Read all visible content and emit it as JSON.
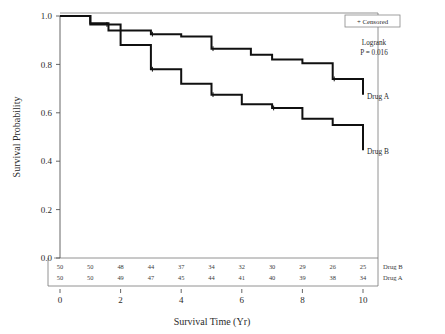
{
  "chart_data": {
    "type": "line",
    "subtype": "kaplan-meier-step",
    "title": "",
    "xlabel": "Survival Time (Yr)",
    "ylabel": "Survival Probability",
    "xlim": [
      0,
      10
    ],
    "ylim": [
      0.0,
      1.0
    ],
    "xticks": [
      0,
      2,
      4,
      6,
      8,
      10
    ],
    "xtick_labels": [
      "0",
      "2",
      "4",
      "6",
      "8",
      "10"
    ],
    "yticks": [
      0.0,
      0.2,
      0.4,
      0.6,
      0.8,
      1.0
    ],
    "ytick_labels": [
      "0.0",
      "0.2",
      "0.4",
      "0.6",
      "0.8",
      "1.0"
    ],
    "grid": false,
    "legend_position": "top-right",
    "series": [
      {
        "name": "Drug A",
        "end_label": "Drug A",
        "x": [
          0.0,
          1.0,
          1.0,
          1.6,
          1.6,
          3.0,
          3.0,
          4.0,
          4.0,
          5.0,
          5.0,
          6.3,
          6.3,
          7.0,
          7.0,
          8.0,
          8.0,
          9.0,
          9.0,
          10.0,
          10.0
        ],
        "y": [
          1.0,
          1.0,
          0.97,
          0.97,
          0.94,
          0.94,
          0.925,
          0.925,
          0.915,
          0.915,
          0.865,
          0.865,
          0.84,
          0.84,
          0.82,
          0.82,
          0.805,
          0.805,
          0.74,
          0.74,
          0.675
        ],
        "steps": [
          {
            "time": 0.0,
            "survival": 1.0
          },
          {
            "time": 1.0,
            "survival": 0.97
          },
          {
            "time": 1.6,
            "survival": 0.94
          },
          {
            "time": 3.0,
            "survival": 0.925
          },
          {
            "time": 4.0,
            "survival": 0.915
          },
          {
            "time": 5.0,
            "survival": 0.865
          },
          {
            "time": 6.3,
            "survival": 0.84
          },
          {
            "time": 7.0,
            "survival": 0.82
          },
          {
            "time": 8.0,
            "survival": 0.805
          },
          {
            "time": 9.0,
            "survival": 0.74
          },
          {
            "time": 10.0,
            "survival": 0.675
          }
        ]
      },
      {
        "name": "Drug B",
        "end_label": "Drug B",
        "x": [
          0.0,
          1.0,
          1.0,
          2.0,
          2.0,
          3.0,
          3.0,
          4.0,
          4.0,
          5.0,
          5.0,
          6.0,
          6.0,
          7.0,
          7.0,
          8.0,
          8.0,
          9.0,
          9.0,
          10.0,
          10.0
        ],
        "y": [
          1.0,
          1.0,
          0.965,
          0.965,
          0.88,
          0.88,
          0.78,
          0.78,
          0.72,
          0.72,
          0.675,
          0.675,
          0.635,
          0.635,
          0.62,
          0.62,
          0.575,
          0.575,
          0.55,
          0.55,
          0.445
        ],
        "steps": [
          {
            "time": 0.0,
            "survival": 1.0
          },
          {
            "time": 1.0,
            "survival": 0.965
          },
          {
            "time": 2.0,
            "survival": 0.88
          },
          {
            "time": 3.0,
            "survival": 0.78
          },
          {
            "time": 4.0,
            "survival": 0.72
          },
          {
            "time": 5.0,
            "survival": 0.675
          },
          {
            "time": 6.0,
            "survival": 0.635
          },
          {
            "time": 7.0,
            "survival": 0.62
          },
          {
            "time": 8.0,
            "survival": 0.575
          },
          {
            "time": 9.0,
            "survival": 0.55
          },
          {
            "time": 10.0,
            "survival": 0.445
          }
        ]
      }
    ],
    "censored_marks": [
      {
        "series": "Drug A",
        "time": 3.05,
        "survival": 0.925
      },
      {
        "series": "Drug A",
        "time": 5.05,
        "survival": 0.865
      },
      {
        "series": "Drug A",
        "time": 9.05,
        "survival": 0.74
      },
      {
        "series": "Drug B",
        "time": 1.55,
        "survival": 0.965
      },
      {
        "series": "Drug B",
        "time": 3.05,
        "survival": 0.78
      },
      {
        "series": "Drug B",
        "time": 5.05,
        "survival": 0.675
      },
      {
        "series": "Drug B",
        "time": 7.05,
        "survival": 0.62
      }
    ],
    "annotations": {
      "test_name": "Logrank",
      "p_value": "P = 0.016"
    },
    "legend": {
      "entries": [
        "+ Censored"
      ],
      "censored_label": "+ Censored"
    },
    "risk_table": {
      "times": [
        0,
        1,
        2,
        3,
        4,
        5,
        6,
        7,
        8,
        9,
        10
      ],
      "rows": [
        {
          "label": "Drug B",
          "counts": [
            50,
            50,
            48,
            44,
            37,
            34,
            32,
            30,
            29,
            26,
            25
          ]
        },
        {
          "label": "Drug A",
          "counts": [
            50,
            50,
            49,
            47,
            45,
            44,
            41,
            40,
            39,
            38,
            34
          ]
        }
      ]
    },
    "colors": {
      "curve": "#101010",
      "axis": "#555555",
      "frame": "#777777",
      "text": "#2b2b2b",
      "background": "#ffffff"
    }
  }
}
